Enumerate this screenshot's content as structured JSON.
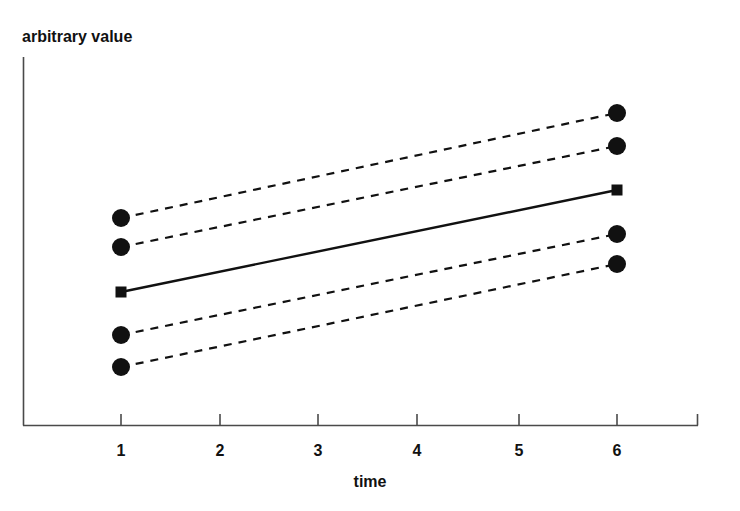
{
  "chart_data": {
    "type": "line",
    "title": "",
    "subtitle": "",
    "xlabel": "time",
    "ylabel": "arbitrary value",
    "x": [
      1,
      6
    ],
    "xlim": [
      0.0,
      6.85
    ],
    "ylim": [
      0,
      100
    ],
    "xticks": [
      1,
      2,
      3,
      4,
      5,
      6
    ],
    "xtick_labels": [
      "1",
      "2",
      "3",
      "4",
      "5",
      "6"
    ],
    "yticks": [],
    "ytick_labels": [],
    "grid": false,
    "legend": null,
    "legend_position": "none",
    "annotations": [],
    "series": [
      {
        "name": "upper-outer",
        "style": "dashed",
        "marker": "circle",
        "values": [
          56.3,
          84.8
        ],
        "points_px": [
          [
            121,
            218
          ],
          [
            617,
            113
          ]
        ]
      },
      {
        "name": "upper-inner",
        "style": "dashed",
        "marker": "circle",
        "values": [
          48.4,
          75.8
        ],
        "points_px": [
          [
            121,
            247
          ],
          [
            617,
            146
          ]
        ]
      },
      {
        "name": "mean",
        "style": "solid",
        "marker": "square",
        "values": [
          36.1,
          63.9
        ],
        "points_px": [
          [
            121,
            292
          ],
          [
            617,
            190
          ]
        ]
      },
      {
        "name": "lower-inner",
        "style": "dashed",
        "marker": "circle",
        "values": [
          24.5,
          51.9
        ],
        "points_px": [
          [
            121,
            335
          ],
          [
            617,
            234
          ]
        ]
      },
      {
        "name": "lower-outer",
        "style": "dashed",
        "marker": "circle",
        "values": [
          15.8,
          43.8
        ],
        "points_px": [
          [
            121,
            367
          ],
          [
            617,
            264
          ]
        ]
      }
    ]
  },
  "axes": {
    "y_axis_label": "arbitrary value",
    "x_axis_label": "time",
    "x_tick_labels": [
      "1",
      "2",
      "3",
      "4",
      "5",
      "6"
    ]
  },
  "colors": {
    "ink": "#111111",
    "axis": "#4a4a4a",
    "background": "#ffffff"
  }
}
